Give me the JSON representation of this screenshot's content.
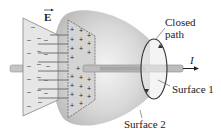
{
  "diagram": {
    "type": "physics-illustration",
    "labels": {
      "field": "E",
      "closed_path": "Closed\npath",
      "closed_path_line1": "Closed",
      "closed_path_line2": "path",
      "current": "I",
      "surface1": "Surface 1",
      "surface2": "Surface 2"
    },
    "plates": {
      "negative_plate_charge": "−",
      "positive_plate_charge": "+"
    },
    "colors": {
      "surface_shade": "#c8c8c8",
      "plate_neg": "#e0e0e0",
      "plate_pos": "#d8d8d8",
      "wire": "#b8b8b8",
      "ink": "#333333"
    },
    "left_edge_fragments": [
      "r",
      "l",
      "s",
      "i",
      "s",
      "l",
      ".",
      "e"
    ]
  }
}
